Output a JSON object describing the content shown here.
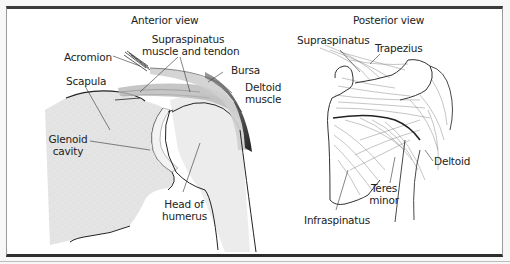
{
  "figure": {
    "anterior": {
      "title": "Anterior view",
      "labels": {
        "acromion": "Acromion",
        "supraspinatus_l1": "Supraspinatus",
        "supraspinatus_l2": "muscle and tendon",
        "bursa": "Bursa",
        "deltoid_l1": "Deltoid",
        "deltoid_l2": "muscle",
        "scapula": "Scapula",
        "glenoid_l1": "Glenoid",
        "glenoid_l2": "cavity",
        "humerus_l1": "Head of",
        "humerus_l2": "humerus"
      }
    },
    "posterior": {
      "title": "Posterior view",
      "labels": {
        "supraspinatus": "Supraspinatus",
        "trapezius": "Trapezius",
        "deltoid": "Deltoid",
        "teres_l1": "Teres",
        "teres_l2": "minor",
        "infraspinatus": "Infraspinatus"
      }
    },
    "colors": {
      "frame_top": "#3a3a3a",
      "bone_fill": "#e6e6e6",
      "muscle_dark": "#3c3c3c",
      "line": "#333333"
    }
  }
}
